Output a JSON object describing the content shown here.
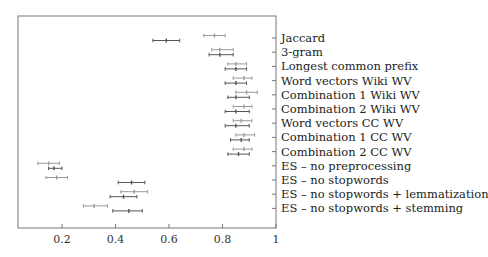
{
  "chart_data": {
    "type": "errorbar",
    "title": "",
    "xlabel": "",
    "ylabel": "",
    "xlim": [
      0.035,
      1.0
    ],
    "xticks": [
      0.2,
      0.4,
      0.6,
      0.8,
      1
    ],
    "xtick_labels": [
      "0.2",
      "0.4",
      "0.6",
      "0.8",
      "1"
    ],
    "grid": false,
    "legend": null,
    "categories": [
      "Jaccard",
      "3-gram",
      "Longest common prefix",
      "Word vectors Wiki WV",
      "Combination 1 Wiki WV",
      "Combination 2 Wiki WV",
      "Word vectors CC WV",
      "Combination 1 CC WV",
      "Combination 2 CC WV",
      "ES – no preprocessing",
      "ES – no stopwords",
      "ES – no stopwords + lemmatization",
      "ES – no stopwords + stemming"
    ],
    "series": [
      {
        "name": "light (upper bar)",
        "color": "#9a9a9a",
        "center": [
          0.77,
          0.79,
          0.85,
          0.88,
          0.89,
          0.88,
          0.87,
          0.88,
          0.88,
          0.15,
          0.18,
          0.47,
          0.32
        ],
        "low": [
          0.73,
          0.76,
          0.82,
          0.84,
          0.85,
          0.84,
          0.84,
          0.85,
          0.84,
          0.11,
          0.14,
          0.42,
          0.28
        ],
        "high": [
          0.81,
          0.84,
          0.89,
          0.91,
          0.93,
          0.91,
          0.91,
          0.92,
          0.91,
          0.19,
          0.22,
          0.52,
          0.37
        ]
      },
      {
        "name": "dark (lower bar)",
        "color": "#555555",
        "center": [
          0.59,
          0.79,
          0.85,
          0.85,
          0.85,
          0.85,
          0.85,
          0.87,
          0.86,
          0.17,
          0.46,
          0.43,
          0.45
        ],
        "low": [
          0.54,
          0.75,
          0.81,
          0.81,
          0.82,
          0.81,
          0.81,
          0.83,
          0.82,
          0.15,
          0.41,
          0.38,
          0.39
        ],
        "high": [
          0.64,
          0.84,
          0.89,
          0.89,
          0.9,
          0.9,
          0.9,
          0.9,
          0.9,
          0.2,
          0.51,
          0.48,
          0.5
        ]
      }
    ]
  }
}
